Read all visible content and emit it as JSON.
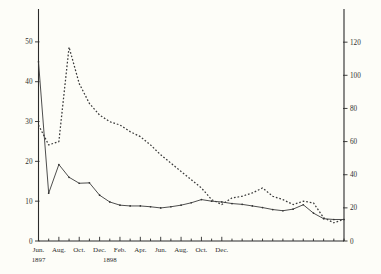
{
  "chart_data": {
    "type": "line",
    "title": "",
    "subtitle": "",
    "xlabel": "",
    "ylabel": "",
    "grid": false,
    "legend": "none",
    "x": [
      "Jun. 1897",
      "Jul. 1897",
      "Aug. 1897",
      "Sep. 1897",
      "Oct. 1897",
      "Nov. 1897",
      "Dec. 1897",
      "Jan. 1898",
      "Feb. 1898",
      "Mar. 1898",
      "Apr. 1898",
      "May 1898",
      "Jun. 1898",
      "Jul. 1898",
      "Aug. 1898",
      "Sep. 1898",
      "Oct. 1898",
      "Nov. 1898",
      "Dec. 1898",
      "Jan. 1899",
      "Feb. 1899",
      "Mar. 1899",
      "Apr. 1899",
      "May 1899",
      "Jun. 1899",
      "Jul. 1899",
      "Aug. 1899",
      "Sep. 1899",
      "Oct. 1899",
      "Nov. 1899",
      "Dec. 1899"
    ],
    "x_tick_labels": [
      {
        "label": "Jun.",
        "index": 0
      },
      {
        "label": "Aug.",
        "index": 2
      },
      {
        "label": "Oct.",
        "index": 4
      },
      {
        "label": "Dec.",
        "index": 6
      },
      {
        "label": "Feb.",
        "index": 8
      },
      {
        "label": "Apr.",
        "index": 10
      },
      {
        "label": "Jun.",
        "index": 12
      },
      {
        "label": "Aug.",
        "index": 14
      },
      {
        "label": "Oct.",
        "index": 16
      },
      {
        "label": "Dec.",
        "index": 18
      }
    ],
    "x_year_labels": [
      {
        "label": "1897",
        "index": 0
      },
      {
        "label": "1898",
        "index": 7
      }
    ],
    "left_axis": {
      "label": "",
      "ticks": [
        0,
        10,
        20,
        30,
        40,
        50
      ],
      "ylim": [
        0,
        57
      ]
    },
    "right_axis": {
      "label": "",
      "ticks": [
        0,
        20,
        40,
        60,
        80,
        100,
        120
      ],
      "ylim": [
        0,
        137
      ]
    },
    "series": [
      {
        "name": "solid-series",
        "style": "solid",
        "axis": "left",
        "values": [
          45.0,
          12.0,
          19.2,
          16.0,
          14.5,
          14.6,
          11.5,
          9.8,
          9.0,
          8.8,
          8.8,
          8.6,
          8.3,
          8.6,
          9.0,
          9.6,
          10.4,
          10.0,
          9.8,
          9.4,
          9.2,
          8.8,
          8.4,
          7.9,
          7.6,
          8.0,
          9.1,
          7.0,
          5.6,
          5.4,
          5.4
        ]
      },
      {
        "name": "dashed-series",
        "style": "dashed",
        "axis": "right",
        "values": [
          70.0,
          58.0,
          60.0,
          117.0,
          95.0,
          83.0,
          76.0,
          72.0,
          70.0,
          66.0,
          63.0,
          58.0,
          52.0,
          47.0,
          42.0,
          37.0,
          32.0,
          25.0,
          22.0,
          26.0,
          27.0,
          29.0,
          32.0,
          27.0,
          25.0,
          22.0,
          24.0,
          23.0,
          14.0,
          11.0,
          13.0
        ]
      }
    ],
    "annotations": []
  },
  "figure": {
    "background_color": "#fdfdf8",
    "ink_color": "#2d2d2d"
  }
}
